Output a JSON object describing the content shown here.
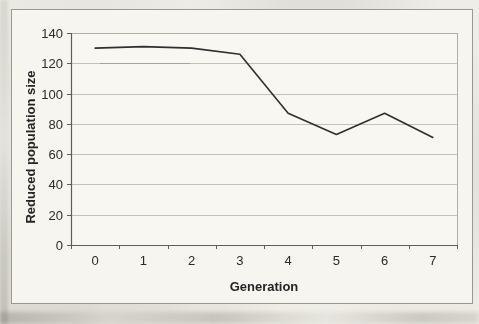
{
  "chart_data": {
    "type": "line",
    "categories": [
      "0",
      "1",
      "2",
      "3",
      "4",
      "5",
      "6",
      "7"
    ],
    "values": [
      130,
      131,
      130,
      126,
      87,
      73,
      87,
      71
    ],
    "series_count": 1,
    "title": "",
    "xlabel": "Generation",
    "ylabel": "Reduced population size",
    "ylim": [
      0,
      140
    ],
    "yticks": [
      0,
      20,
      40,
      60,
      80,
      100,
      120,
      140
    ],
    "grid": "horizontal",
    "legend": "none",
    "colors": {
      "line": "#2f2f2f",
      "grid": "#c3c1bc",
      "axis": "#5f5d59",
      "text": "#2b2b2b",
      "plot_border": "#b0aea8",
      "frame_border": "#9a9892",
      "paper": "#f7f5f0",
      "plot_fill": "#f9f7f2"
    }
  }
}
